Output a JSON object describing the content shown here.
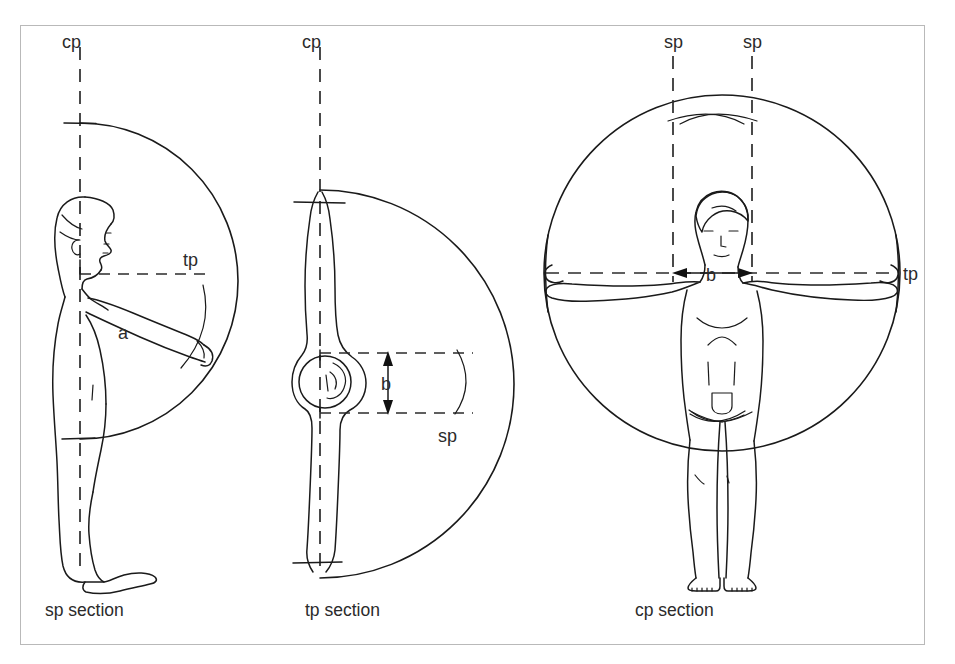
{
  "figure": {
    "background_color": "#ffffff",
    "line_color": "#1a1a1a",
    "frame_color": "#b9b9b9"
  },
  "panels": [
    {
      "id": "sp",
      "caption": "sp section",
      "view": "side profile, standing figure facing right, arm extended forward",
      "vertical_axis_label": "cp",
      "horizontal_axis_label": "tp",
      "dimension_label": "a",
      "arc": "semicircle opening left, centred on shoulder axis"
    },
    {
      "id": "tp",
      "caption": "tp section",
      "view": "top / plan view, figure seen from above with arms outstretched",
      "vertical_axis_label": "cp",
      "plane_label": "sp",
      "dimension_label": "b",
      "arc": "semicircle opening left, centred on the body axis"
    },
    {
      "id": "cp",
      "caption": "cp section",
      "view": "frontal view, figure standing with arms outstretched",
      "plane_labels": [
        "sp",
        "sp"
      ],
      "horizontal_axis_label": "tp",
      "dimension_label": "b",
      "arc": "full circle enclosing the figure, centred at shoulder height"
    }
  ],
  "labels": {
    "cp_left": "cp",
    "cp_middle": "cp",
    "sp_right_left": "sp",
    "sp_right_right": "sp",
    "tp_left": "tp",
    "tp_right": "tp",
    "sp_middle": "sp",
    "dim_a": "a",
    "dim_b_middle": "b",
    "dim_b_right": "b",
    "caption_left": "sp section",
    "caption_middle": "tp section",
    "caption_right": "cp section"
  }
}
